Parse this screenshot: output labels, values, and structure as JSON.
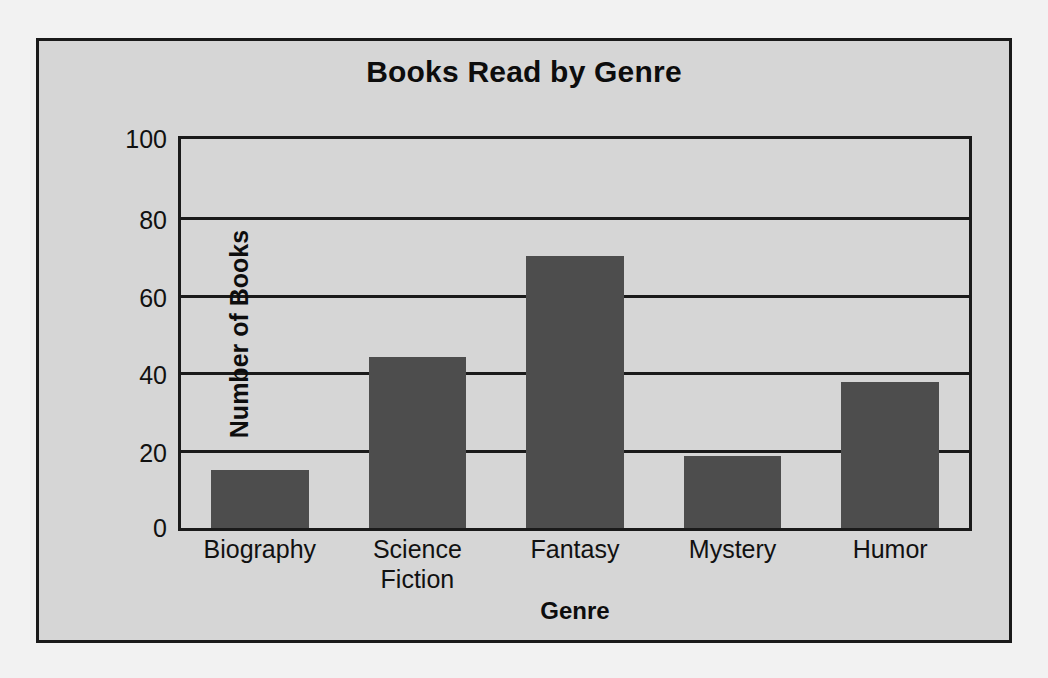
{
  "chart_data": {
    "type": "bar",
    "title": "Books Read by Genre",
    "xlabel": "Genre",
    "ylabel": "Number of Books",
    "categories": [
      "Biography",
      "Science Fiction",
      "Fantasy",
      "Mystery",
      "Humor"
    ],
    "values": [
      15,
      44,
      70,
      18.5,
      37.5
    ],
    "ylim": [
      0,
      100
    ],
    "yticks": [
      0,
      20,
      40,
      60,
      80,
      100
    ],
    "ytick_labels": [
      "0",
      "20",
      "40",
      "60",
      "80",
      "100"
    ],
    "grid": true,
    "legend": false,
    "colors": {
      "bar": "#4d4d4d",
      "background": "#d6d6d6",
      "page_background": "#f2f2f2",
      "axis": "#1a1a1a",
      "text": "#111111"
    }
  },
  "category_display": [
    "Biography",
    "Science\nFiction",
    "Fantasy",
    "Mystery",
    "Humor"
  ]
}
